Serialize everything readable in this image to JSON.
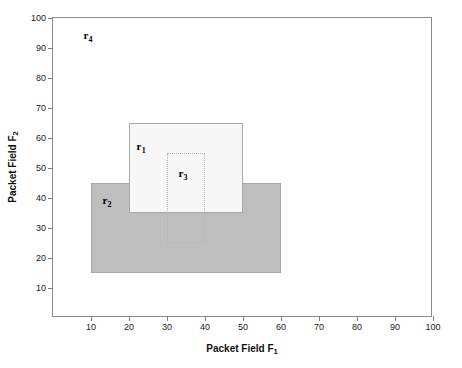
{
  "chart_data": {
    "type": "scatter",
    "title": "",
    "xlabel": "Packet Field F1",
    "ylabel": "Packet Field F2",
    "xlim": [
      0,
      100
    ],
    "ylim": [
      0,
      100
    ],
    "grid": false,
    "legend": "none",
    "xticks": [
      10,
      20,
      30,
      40,
      50,
      60,
      70,
      80,
      90,
      100
    ],
    "yticks": [
      10,
      20,
      30,
      40,
      50,
      60,
      70,
      80,
      90,
      100
    ],
    "rectangles": [
      {
        "name": "r1",
        "label": "r",
        "subscript": "1",
        "x0": 20,
        "x1": 50,
        "y0": 35,
        "y1": 65,
        "fill": "#f7f7f7",
        "border": "#a8a8a8",
        "border_style": "solid",
        "label_x": 22,
        "label_y": 59,
        "z": 2
      },
      {
        "name": "r2",
        "label": "r",
        "subscript": "2",
        "x0": 10,
        "x1": 60,
        "y0": 15,
        "y1": 45,
        "fill": "#bebebe",
        "border": "#a8a8a8",
        "border_style": "solid",
        "label_x": 13,
        "label_y": 41,
        "z": 1
      },
      {
        "name": "r3",
        "label": "r",
        "subscript": "3",
        "x0": 30,
        "x1": 40,
        "y0": 25,
        "y1": 55,
        "fill": "transparent",
        "border": "#b4b4b4",
        "border_style": "dotted",
        "label_x": 33,
        "label_y": 50,
        "z": 3
      },
      {
        "name": "r4",
        "label": "r",
        "subscript": "4",
        "x0": null,
        "x1": null,
        "y0": null,
        "y1": null,
        "fill": "none",
        "border": "none",
        "border_style": "none",
        "label_x": 8,
        "label_y": 96,
        "z": 4
      }
    ]
  },
  "axes": {
    "x_title_main": "Packet Field F",
    "x_title_sub": "1",
    "y_title_main": "Packet Field F",
    "y_title_sub": "2"
  },
  "colors": {
    "frame": "#8a8a8a",
    "tick": "#7d7d7d",
    "text": "#111111",
    "rect1_fill": "#f7f7f7",
    "rect2_fill": "#bebebe",
    "rect3_border": "#b4b4b4",
    "background": "#ffffff"
  }
}
